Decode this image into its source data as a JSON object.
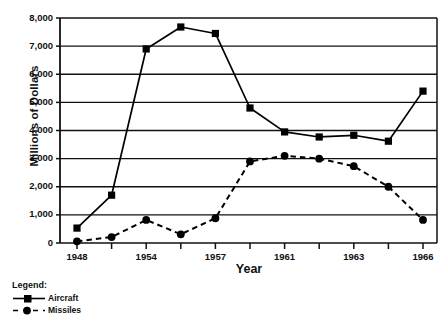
{
  "chart_data": {
    "type": "line",
    "title": "",
    "xlabel": "Year",
    "ylabel": "Millions of Dollars",
    "x": [
      1948,
      1950,
      1954,
      1956,
      1957,
      1958,
      1961,
      1962,
      1963,
      1964,
      1966
    ],
    "categories": [
      "1948",
      "1950",
      "1954",
      "1956",
      "1957",
      "1958",
      "1961",
      "1962",
      "1963",
      "1964",
      "1966"
    ],
    "xtick_labels": [
      "1948",
      "",
      "1954",
      "",
      "1957",
      "",
      "1961",
      "",
      "1963",
      "",
      "1966"
    ],
    "ytick_labels": [
      "0",
      "1,000",
      "2,000",
      "3,000",
      "4,000",
      "5,000",
      "6,000",
      "7,000",
      "8,000"
    ],
    "ytick_values": [
      0,
      1000,
      2000,
      3000,
      4000,
      5000,
      6000,
      7000,
      8000
    ],
    "ylim": [
      0,
      8000
    ],
    "grid": "horizontal",
    "legend_position": "below-left",
    "series": [
      {
        "name": "Aircraft",
        "marker": "square",
        "linestyle": "solid",
        "color": "#000000",
        "values": [
          530,
          1700,
          6900,
          7680,
          7450,
          4800,
          3950,
          3770,
          3830,
          3620,
          5400
        ]
      },
      {
        "name": "Missiles",
        "marker": "circle",
        "linestyle": "dashed",
        "color": "#000000",
        "values": [
          60,
          210,
          820,
          310,
          880,
          2900,
          3100,
          3000,
          2730,
          2000,
          820
        ]
      }
    ]
  },
  "legend": {
    "title": "Legend:",
    "entries": [
      {
        "label": "Aircraft",
        "marker": "square",
        "linestyle": "solid"
      },
      {
        "label": "Missiles",
        "marker": "circle",
        "linestyle": "dashed"
      }
    ]
  },
  "axis": {
    "x_title": "Year",
    "y_title": "Millions of Dollars"
  }
}
